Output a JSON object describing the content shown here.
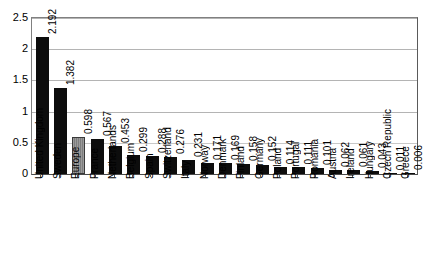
{
  "chart_data": {
    "type": "bar",
    "title": "",
    "subtitle": "",
    "xlabel": "",
    "ylabel": "",
    "ylim": [
      0,
      2.5
    ],
    "grid": true,
    "legend": "none",
    "y_ticks": [
      "0",
      "0.5",
      "1",
      "1.5",
      "2",
      "2.5"
    ],
    "y_tick_values": [
      0,
      0.5,
      1,
      1.5,
      2,
      2.5
    ],
    "categories": [
      "United Kingdom",
      "Sweden",
      "Europe",
      "France",
      "Netherlands",
      "Belgium",
      "Spain",
      "Switzerland",
      "Italy",
      "Norway",
      "Denmark",
      "Finland",
      "Germany",
      "Poland",
      "Portugal",
      "Romania",
      "Austria",
      "Ireland",
      "Hungary",
      "Czech Republic",
      "Greece"
    ],
    "values": [
      2.192,
      1.382,
      0.598,
      0.567,
      0.453,
      0.299,
      0.288,
      0.276,
      0.231,
      0.171,
      0.169,
      0.158,
      0.152,
      0.114,
      0.111,
      0.101,
      0.062,
      0.061,
      0.043,
      0.011,
      0.006
    ],
    "value_labels": [
      "2.192",
      "1.382",
      "0.598",
      "0.567",
      "0.453",
      "0.299",
      "0.288",
      "0.276",
      "0.231",
      "0.171",
      "0.169",
      "0.158",
      "0.152",
      "0.114",
      "0.111",
      "0.101",
      "0.062",
      "0.061",
      "0.043",
      "0.011",
      "0.006"
    ],
    "highlight_index": 2,
    "colors": {
      "bar": "#0d0d0d",
      "bar_highlight": "#8f8f8f",
      "gridline": "#b4b4b4",
      "axis": "#4a4a4a",
      "text": "#000000",
      "background": "#ffffff"
    }
  }
}
